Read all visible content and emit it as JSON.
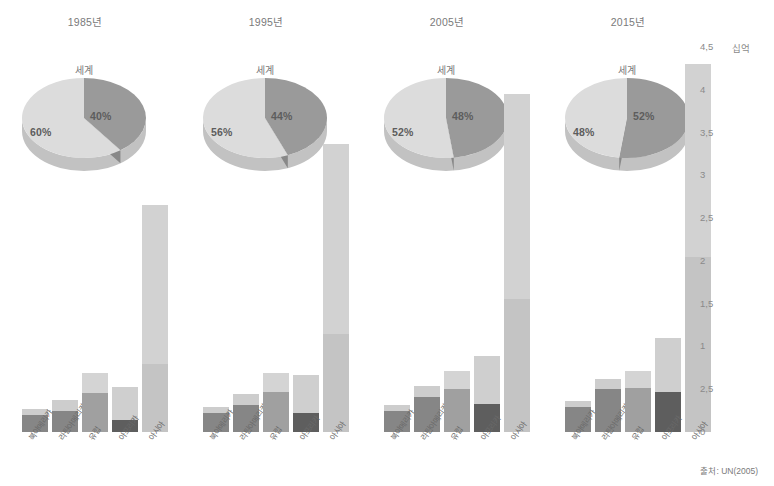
{
  "axis": {
    "unit_label": "십억",
    "ticks": [
      "4,5",
      "4",
      "3,5",
      "3",
      "2,5",
      "2",
      "1,5",
      "1",
      "2,5",
      "0"
    ],
    "tick_values": [
      4.5,
      4,
      3.5,
      3,
      2.5,
      2,
      1.5,
      1,
      0.5,
      0
    ],
    "max": 4.5,
    "min": 0
  },
  "source_note": "출처: UN(2005)",
  "pie_caption": "세계",
  "categories": [
    "북아메리카",
    "라틴아메리카",
    "유럽",
    "아프리카",
    "아시아"
  ],
  "colors": {
    "urban": "#8e8e8e",
    "rural": "#cfcfcf",
    "urban_dark": "#575757",
    "urban_mid": "#7d7d7d",
    "pie_urban": "#9a9a9a",
    "pie_rural": "#dcdcdc",
    "text": "#6f6f6f"
  },
  "groups": [
    {
      "title": "1985년",
      "pie": {
        "urban_pct": "40%",
        "rural_pct": "60%",
        "urban_value": 40,
        "rural_value": 60
      },
      "bars": [
        {
          "category": "북아메리카",
          "urban": 0.2,
          "rural": 0.07,
          "total": 0.27,
          "shade": "mid"
        },
        {
          "category": "라틴아메리카",
          "urban": 0.24,
          "rural": 0.14,
          "total": 0.38,
          "shade": "mid"
        },
        {
          "category": "유럽",
          "urban": 0.46,
          "rural": 0.23,
          "total": 0.69,
          "shade": "light"
        },
        {
          "category": "아프리카",
          "urban": 0.14,
          "rural": 0.39,
          "total": 0.53,
          "shade": "dark"
        },
        {
          "category": "아시아",
          "urban": 0.8,
          "rural": 1.85,
          "total": 2.65,
          "shade": "pale"
        }
      ]
    },
    {
      "title": "1995년",
      "pie": {
        "urban_pct": "44%",
        "rural_pct": "56%",
        "urban_value": 44,
        "rural_value": 56
      },
      "bars": [
        {
          "category": "북아메리카",
          "urban": 0.22,
          "rural": 0.07,
          "total": 0.29,
          "shade": "mid"
        },
        {
          "category": "라틴아메리카",
          "urban": 0.31,
          "rural": 0.14,
          "total": 0.45,
          "shade": "mid"
        },
        {
          "category": "유럽",
          "urban": 0.47,
          "rural": 0.22,
          "total": 0.69,
          "shade": "light"
        },
        {
          "category": "아프리카",
          "urban": 0.22,
          "rural": 0.45,
          "total": 0.67,
          "shade": "dark"
        },
        {
          "category": "아시아",
          "urban": 1.15,
          "rural": 2.22,
          "total": 3.37,
          "shade": "pale"
        }
      ]
    },
    {
      "title": "2005년",
      "pie": {
        "urban_pct": "48%",
        "rural_pct": "52%",
        "urban_value": 48,
        "rural_value": 52
      },
      "bars": [
        {
          "category": "북아메리카",
          "urban": 0.25,
          "rural": 0.07,
          "total": 0.32,
          "shade": "mid"
        },
        {
          "category": "라틴아메리카",
          "urban": 0.41,
          "rural": 0.13,
          "total": 0.54,
          "shade": "mid"
        },
        {
          "category": "유럽",
          "urban": 0.5,
          "rural": 0.21,
          "total": 0.71,
          "shade": "light"
        },
        {
          "category": "아프리카",
          "urban": 0.33,
          "rural": 0.56,
          "total": 0.89,
          "shade": "dark"
        },
        {
          "category": "아시아",
          "urban": 1.55,
          "rural": 2.4,
          "total": 3.95,
          "shade": "pale"
        }
      ]
    },
    {
      "title": "2015년",
      "pie": {
        "urban_pct": "52%",
        "rural_pct": "48%",
        "urban_value": 52,
        "rural_value": 48
      },
      "bars": [
        {
          "category": "북아메리카",
          "urban": 0.29,
          "rural": 0.07,
          "total": 0.36,
          "shade": "mid"
        },
        {
          "category": "라틴아메리카",
          "urban": 0.5,
          "rural": 0.12,
          "total": 0.62,
          "shade": "mid"
        },
        {
          "category": "유럽",
          "urban": 0.52,
          "rural": 0.19,
          "total": 0.71,
          "shade": "light"
        },
        {
          "category": "아프리카",
          "urban": 0.47,
          "rural": 0.63,
          "total": 1.1,
          "shade": "dark"
        },
        {
          "category": "아시아",
          "urban": 2.05,
          "rural": 2.25,
          "total": 4.3,
          "shade": "pale"
        }
      ]
    }
  ],
  "chart_data": {
    "type": "bar",
    "title": "",
    "subtitle": "",
    "xlabel": "",
    "ylabel": "십억",
    "ylim": [
      0,
      4.5
    ],
    "grid": false,
    "legend": "none",
    "stacked": true,
    "categories": [
      "북아메리카",
      "라틴아메리카",
      "유럽",
      "아프리카",
      "아시아"
    ],
    "panels": [
      "1985년",
      "1995년",
      "2005년",
      "2015년"
    ],
    "series": [
      {
        "name": "도시 인구",
        "panel": "1985년",
        "values": [
          0.2,
          0.24,
          0.46,
          0.14,
          0.8
        ]
      },
      {
        "name": "촌락 인구",
        "panel": "1985년",
        "values": [
          0.07,
          0.14,
          0.23,
          0.39,
          1.85
        ]
      },
      {
        "name": "도시 인구",
        "panel": "1995년",
        "values": [
          0.22,
          0.31,
          0.47,
          0.22,
          1.15
        ]
      },
      {
        "name": "촌락 인구",
        "panel": "1995년",
        "values": [
          0.07,
          0.14,
          0.22,
          0.45,
          2.22
        ]
      },
      {
        "name": "도시 인구",
        "panel": "2005년",
        "values": [
          0.25,
          0.41,
          0.5,
          0.33,
          1.55
        ]
      },
      {
        "name": "촌락 인구",
        "panel": "2005년",
        "values": [
          0.07,
          0.13,
          0.21,
          0.56,
          2.4
        ]
      },
      {
        "name": "도시 인구",
        "panel": "2015년",
        "values": [
          0.29,
          0.5,
          0.52,
          0.47,
          2.05
        ]
      },
      {
        "name": "촌락 인구",
        "panel": "2015년",
        "values": [
          0.07,
          0.12,
          0.19,
          0.63,
          2.25
        ]
      }
    ],
    "pies": [
      {
        "panel": "1985년",
        "label": "세계",
        "slices": [
          {
            "name": "40%",
            "value": 40
          },
          {
            "name": "60%",
            "value": 60
          }
        ]
      },
      {
        "panel": "1995년",
        "label": "세계",
        "slices": [
          {
            "name": "44%",
            "value": 44
          },
          {
            "name": "56%",
            "value": 56
          }
        ]
      },
      {
        "panel": "2005년",
        "label": "세계",
        "slices": [
          {
            "name": "48%",
            "value": 48
          },
          {
            "name": "52%",
            "value": 52
          }
        ]
      },
      {
        "panel": "2015년",
        "label": "세계",
        "slices": [
          {
            "name": "52%",
            "value": 52
          },
          {
            "name": "48%",
            "value": 48
          }
        ]
      }
    ],
    "annotations": [
      "출처: UN(2005)"
    ]
  }
}
